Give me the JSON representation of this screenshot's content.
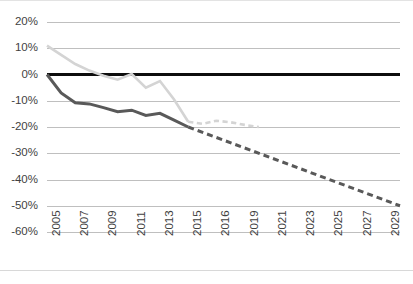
{
  "chart_data": {
    "type": "line",
    "title": "",
    "subtitle": "",
    "xlabel": "",
    "ylabel": "",
    "xlim": [
      2005,
      2030
    ],
    "ylim": [
      -60,
      20
    ],
    "y_tick_labels": [
      "20%",
      "10%",
      "0%",
      "-10%",
      "-20%",
      "-30%",
      "-40%",
      "-50%",
      "-60%"
    ],
    "y_tick_values": [
      20,
      10,
      0,
      -10,
      -20,
      -30,
      -40,
      -50,
      -60
    ],
    "x_tick_labels": [
      "2005",
      "2007",
      "2009",
      "2011",
      "2013",
      "2015",
      "2016",
      "2019",
      "2021",
      "2023",
      "2025",
      "2027",
      "2029"
    ],
    "x_tick_values": [
      2005,
      2007,
      2009,
      2011,
      2013,
      2015,
      2017,
      2019,
      2021,
      2023,
      2025,
      2027,
      2029
    ],
    "grid": true,
    "legend": "none",
    "series": [
      {
        "name": "baseline-zero",
        "color": "#0d0d0d",
        "style": "solid",
        "width": 3,
        "x": [
          2005,
          2030
        ],
        "values": [
          0,
          0
        ]
      },
      {
        "name": "light-gray-series-historical",
        "color": "#d4d4d4",
        "style": "solid",
        "width": 2.6,
        "x": [
          2005,
          2006,
          2007,
          2008,
          2009,
          2010,
          2011,
          2012,
          2013,
          2014,
          2015
        ],
        "values": [
          11.0,
          7.5,
          4.0,
          1.5,
          -0.5,
          -2.0,
          0.2,
          -5.0,
          -2.5,
          -9.5,
          -18.0
        ]
      },
      {
        "name": "light-gray-series-projected",
        "color": "#d4d4d4",
        "style": "dashed",
        "width": 2.6,
        "x": [
          2015,
          2016,
          2017,
          2018,
          2019,
          2020
        ],
        "values": [
          -18.0,
          -18.8,
          -17.6,
          -18.2,
          -19.2,
          -20.0
        ]
      },
      {
        "name": "dark-gray-series-historical",
        "color": "#595959",
        "style": "solid",
        "width": 3,
        "x": [
          2005,
          2006,
          2007,
          2008,
          2009,
          2010,
          2011,
          2012,
          2013,
          2014,
          2015
        ],
        "values": [
          0.0,
          -7.0,
          -10.8,
          -11.2,
          -12.6,
          -14.2,
          -13.6,
          -15.6,
          -14.8,
          -17.4,
          -20.0
        ]
      },
      {
        "name": "dark-gray-series-projected",
        "color": "#595959",
        "style": "dashed",
        "width": 3,
        "x": [
          2015,
          2017,
          2019,
          2021,
          2023,
          2025,
          2027,
          2029,
          2030
        ],
        "values": [
          -20.0,
          -24.0,
          -28.0,
          -32.0,
          -36.0,
          -40.0,
          -44.0,
          -48.0,
          -50.0
        ]
      }
    ]
  }
}
